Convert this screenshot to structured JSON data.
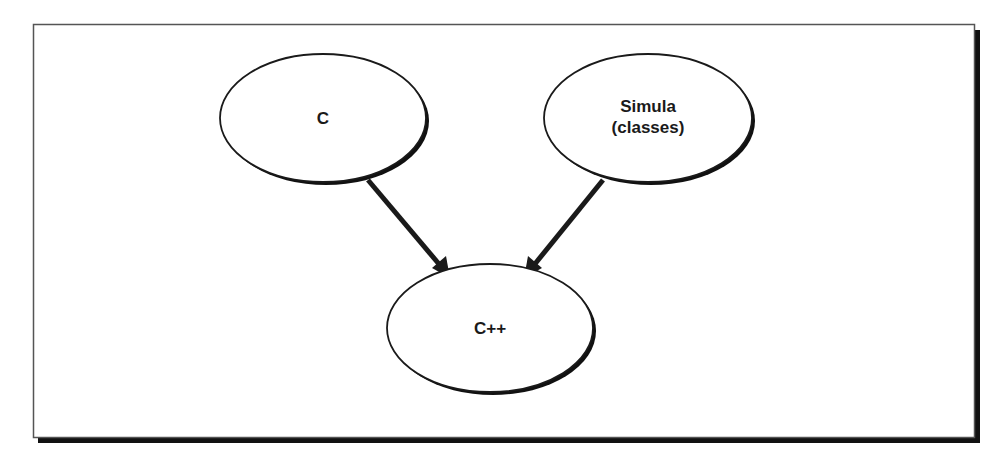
{
  "diagram": {
    "type": "inheritance-graph",
    "frame": {
      "border_color": "#333333",
      "shadow_color": "#111111",
      "background": "#ffffff"
    },
    "nodes": [
      {
        "id": "c",
        "label_lines": [
          "C"
        ]
      },
      {
        "id": "simula",
        "label_lines": [
          "Simula",
          "(classes)"
        ]
      },
      {
        "id": "cpp",
        "label_lines": [
          "C++"
        ]
      }
    ],
    "edges": [
      {
        "from": "c",
        "to": "cpp"
      },
      {
        "from": "simula",
        "to": "cpp"
      }
    ]
  }
}
